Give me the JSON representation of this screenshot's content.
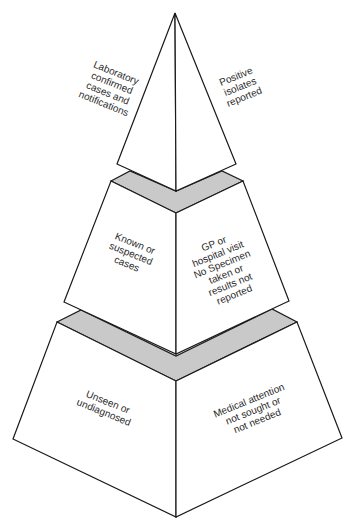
{
  "diagram": {
    "type": "surveillance-pyramid",
    "colors": {
      "face_fill": "#ffffff",
      "band_fill": "#c9c9c9",
      "stroke": "#1a1a1a",
      "text": "#2a2a2a"
    },
    "tiers": [
      {
        "name": "top",
        "left_label": "Laboratory\nconfirmed\ncases and\nnotifications",
        "right_label": "Positive\nisolates\nreported"
      },
      {
        "name": "middle",
        "left_label": "Known or\nsuspected\ncases",
        "right_label": "GP or\nhospital visit\nNo Specimen\ntaken or\nresults not\nreported"
      },
      {
        "name": "bottom",
        "left_label": "Unseen or\nundiagnosed",
        "right_label": "Medical attention\nnot sought or\nnot needed"
      }
    ]
  }
}
